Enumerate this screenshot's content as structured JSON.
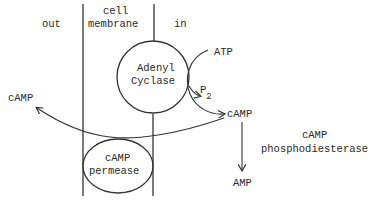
{
  "regions": {
    "out": "out",
    "membrane_line1": "cell",
    "membrane_line2": "membrane",
    "in": "in"
  },
  "enzymes": {
    "adenyl_cyclase_line1": "Adenyl",
    "adenyl_cyclase_line2": "Cyclase",
    "permease_line1": "cAMP",
    "permease_line2": "permease",
    "phosphodiesterase_line1": "cAMP",
    "phosphodiesterase_line2": "phosphodiesterase"
  },
  "molecules": {
    "atp": "ATP",
    "pp": "P",
    "pp_sub": "2",
    "camp_in": "cAMP",
    "camp_out": "cAMP",
    "amp": "AMP"
  },
  "colors": {
    "ink": "#2a2a2a",
    "background": "#ffffff"
  }
}
